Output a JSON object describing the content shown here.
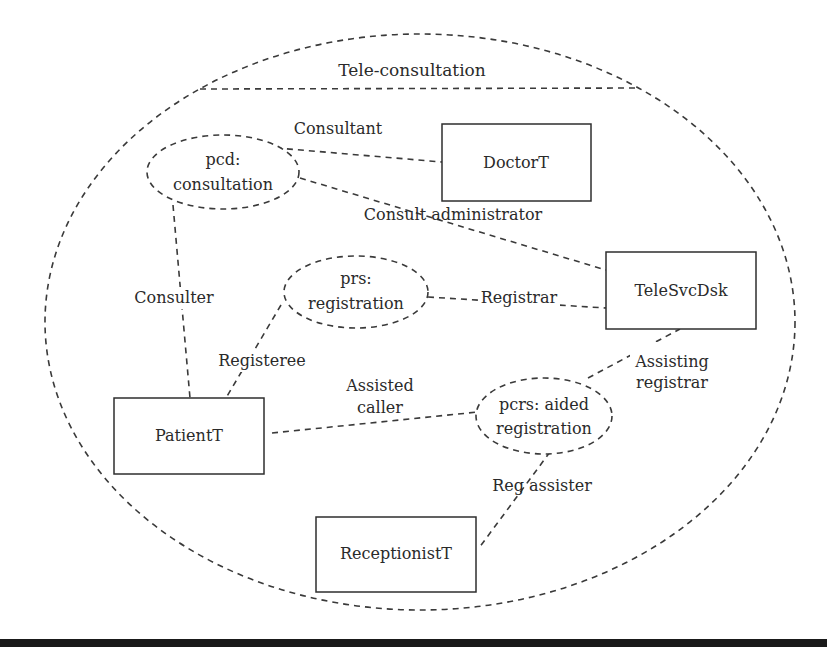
{
  "diagram": {
    "title": "Tele-consultation",
    "types": {
      "doctor": "DoctorT",
      "telesvcdsk": "TeleSvcDsk",
      "patient": "PatientT",
      "receptionist": "ReceptionistT"
    },
    "processes": {
      "consultation": {
        "line1": "pcd:",
        "line2": "consultation"
      },
      "registration": {
        "line1": "prs:",
        "line2": "registration"
      },
      "aided_registration": {
        "line1": "pcrs: aided",
        "line2": "registration"
      }
    },
    "roles": {
      "consultant": "Consultant",
      "consult_administrator": "Consult administrator",
      "consulter": "Consulter",
      "registrar": "Registrar",
      "registeree": "Registeree",
      "assisted_caller_1": "Assisted",
      "assisted_caller_2": "caller",
      "assisting_registrar_1": "Assisting",
      "assisting_registrar_2": "registrar",
      "reg_assister": "Reg assister"
    },
    "colors": {
      "line": "#3a3a3a",
      "text": "#2a2a2a",
      "bottom_rule": "#1a1a1a"
    }
  }
}
